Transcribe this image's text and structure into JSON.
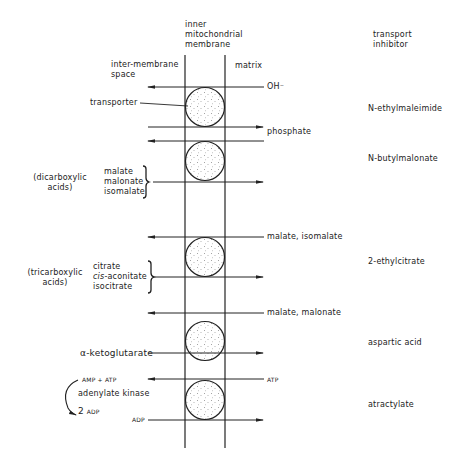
{
  "headers": {
    "membrane": [
      "inner",
      "mitochondrial",
      "membrane"
    ],
    "intermembrane_space": [
      "inter-membrane",
      "space"
    ],
    "matrix": "matrix",
    "inhibitor_column": [
      "transport",
      "inhibitor"
    ]
  },
  "transporter_label": "transporter",
  "rows": [
    {
      "id": "hydroxide-phosphate",
      "in_matrix_out": "OH⁻",
      "in_to_matrix": "phosphate",
      "inhibitor": "N-ethylmaleimide"
    },
    {
      "id": "dicarboxylate",
      "group": [
        "(dicarboxylic",
        "acids)"
      ],
      "substrates": [
        "malate",
        "malonate",
        "isomalate"
      ],
      "inhibitor": "N-butylmalonate"
    },
    {
      "id": "tricarboxylate",
      "out_of_matrix": "malate, isomalate",
      "group": [
        "(tricarboxylic",
        "acids)"
      ],
      "substrates": [
        "citrate",
        "cis-aconitate",
        "isocitrate"
      ],
      "substrate_italic_prefix": "cis",
      "inhibitor": "2-ethylcitrate"
    },
    {
      "id": "oxoglutarate",
      "out_of_matrix": "malate, malonate",
      "substrate": "α-ketoglutarate",
      "inhibitor": "aspartic acid"
    },
    {
      "id": "adenine-nucleotide",
      "out_of_matrix": "ATP",
      "substrate": "ADP",
      "reaction": {
        "reactants": "AMP + ATP",
        "enzyme": "adenylate kinase",
        "product_coeff": "2",
        "product": "ADP"
      },
      "inhibitor": "atractylate"
    }
  ]
}
